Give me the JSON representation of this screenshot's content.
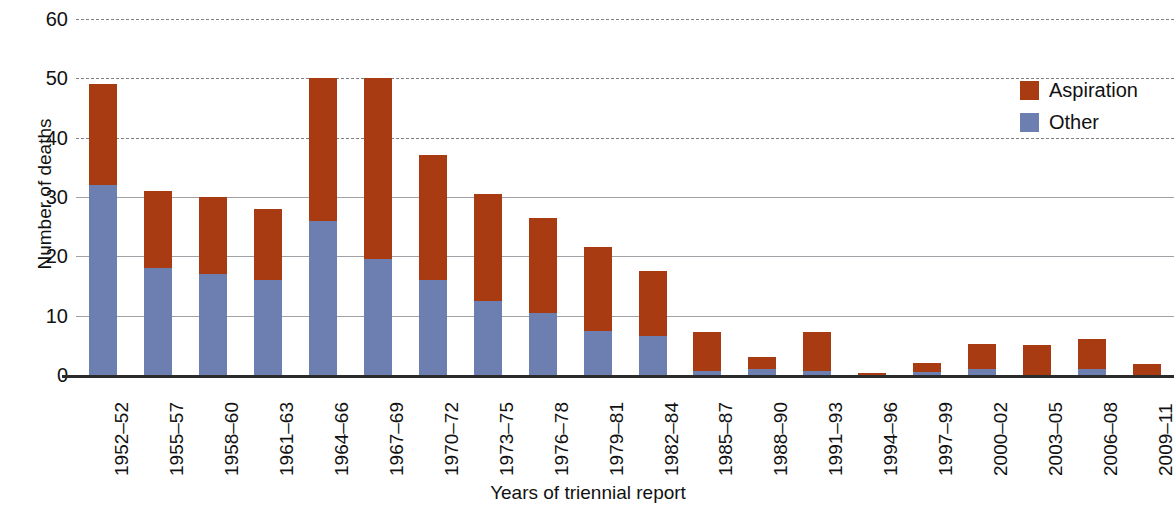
{
  "chart_data": {
    "type": "bar",
    "stacked": true,
    "title": "",
    "xlabel": "Years of triennial report",
    "ylabel": "Number of deaths",
    "ylim": [
      0,
      60
    ],
    "yticks": [
      0,
      10,
      20,
      30,
      40,
      50,
      60
    ],
    "ytick_labels": [
      "0",
      "10",
      "20",
      "30",
      "40",
      "50",
      "60"
    ],
    "grid": true,
    "legend_position": "top-right",
    "categories": [
      "1952–52",
      "1955–57",
      "1958–60",
      "1961–63",
      "1964–66",
      "1967–69",
      "1970–72",
      "1973–75",
      "1976–78",
      "1979–81",
      "1982–84",
      "1985–87",
      "1988–90",
      "1991–93",
      "1994–96",
      "1997–99",
      "2000–02",
      "2003–05",
      "2006–08",
      "2009–11"
    ],
    "series": [
      {
        "name": "Other",
        "color": "#6c7fb0",
        "values": [
          32,
          18,
          17,
          16,
          26,
          19.5,
          16,
          12.5,
          10.5,
          7.5,
          6.5,
          0.7,
          1,
          0.7,
          0,
          0.5,
          1,
          0,
          1,
          0
        ]
      },
      {
        "name": "Aspiration",
        "color": "#a83b12",
        "values": [
          17,
          13,
          13,
          12,
          24,
          30.5,
          21,
          18,
          16,
          14,
          11,
          6.5,
          2,
          6.5,
          0.4,
          1.5,
          4.2,
          5,
          5,
          1.8
        ]
      }
    ],
    "totals": [
      49,
      31,
      30,
      28,
      50,
      50,
      37,
      30.5,
      26.5,
      21.5,
      17.5,
      7.2,
      3,
      7.2,
      0.4,
      2,
      5.2,
      5,
      6,
      1.8
    ]
  },
  "legend": {
    "items": [
      {
        "label": "Aspiration",
        "color": "#a83b12"
      },
      {
        "label": "Other",
        "color": "#6c7fb0"
      }
    ]
  },
  "axes": {
    "y_title": "Number of deaths",
    "x_title": "Years of triennial report"
  }
}
